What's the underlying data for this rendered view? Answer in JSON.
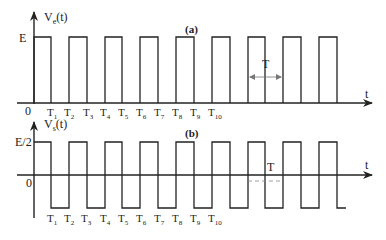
{
  "panel_a": {
    "label": "(a)",
    "y_axis_label": "V",
    "y_axis_sub": "e",
    "y_axis_suffix": "(t)",
    "x_axis_label": "t",
    "origin_label": "0",
    "level_label": "E",
    "period_label": "T",
    "tick_labels": [
      {
        "main": "T",
        "sub": "1"
      },
      {
        "main": "T",
        "sub": "2"
      },
      {
        "main": "T",
        "sub": "3"
      },
      {
        "main": "T",
        "sub": "4"
      },
      {
        "main": "T",
        "sub": "5"
      },
      {
        "main": "T",
        "sub": "6"
      },
      {
        "main": "T",
        "sub": "7"
      },
      {
        "main": "T",
        "sub": "8"
      },
      {
        "main": "T",
        "sub": "9"
      },
      {
        "main": "T",
        "sub": "10"
      }
    ]
  },
  "panel_b": {
    "label": "(b)",
    "y_axis_label": "V",
    "y_axis_sub": "s",
    "y_axis_suffix": "(t)",
    "x_axis_label": "t",
    "origin_label": "0",
    "level_label": "E/2",
    "period_label": "T",
    "tick_labels": [
      {
        "main": "T",
        "sub": "1"
      },
      {
        "main": "T",
        "sub": "2"
      },
      {
        "main": "T",
        "sub": "3"
      },
      {
        "main": "T",
        "sub": "4"
      },
      {
        "main": "T",
        "sub": "5"
      },
      {
        "main": "T",
        "sub": "6"
      },
      {
        "main": "T",
        "sub": "7"
      },
      {
        "main": "T",
        "sub": "8"
      },
      {
        "main": "T",
        "sub": "9"
      },
      {
        "main": "T",
        "sub": "10"
      }
    ]
  },
  "colors": {
    "line": "#222222",
    "dashed": "#888888"
  }
}
